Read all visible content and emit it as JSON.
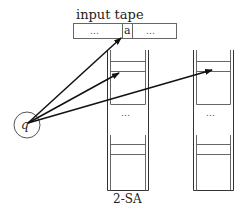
{
  "diagram": {
    "tape": {
      "label": "input tape",
      "cells": [
        "…",
        "a",
        "…"
      ]
    },
    "state": {
      "label": "q"
    },
    "stacks": [
      {
        "id": "stack-1",
        "middle_dots": "…",
        "caption": "2-SA"
      },
      {
        "id": "stack-2",
        "middle_dots": "…",
        "caption": ""
      }
    ],
    "arrows": [
      {
        "from": "state-q",
        "to": "tape-cell-a"
      },
      {
        "from": "state-q",
        "to": "stack-1-top"
      },
      {
        "from": "state-q",
        "to": "stack-2-top"
      }
    ],
    "colors": {
      "line": "#333333",
      "arrow": "#111111",
      "background": "#ffffff"
    }
  }
}
